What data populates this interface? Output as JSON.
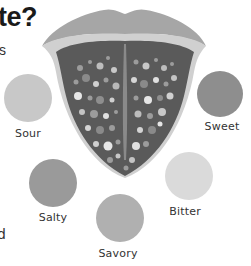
{
  "heading": {
    "title_fragment": "te?",
    "subtitle_fragment": "s",
    "bottom_fragment": "d"
  },
  "tongue": {
    "lip_color": "#a6a6a6",
    "rim_color": "#d0d0d0",
    "body_color": "#5a5a5a",
    "groove_color": "#8a8a8a"
  },
  "tastes": [
    {
      "label": "Sour",
      "color": "#c8c8c8",
      "cx": 28,
      "cy": 98,
      "r": 24,
      "label_x": 28,
      "label_y": 127
    },
    {
      "label": "Sweet",
      "color": "#8e8e8e",
      "cx": 220,
      "cy": 94,
      "r": 23,
      "label_x": 222,
      "label_y": 120
    },
    {
      "label": "Salty",
      "color": "#9a9a9a",
      "cx": 53,
      "cy": 183,
      "r": 24,
      "label_x": 53,
      "label_y": 211
    },
    {
      "label": "Bitter",
      "color": "#dadada",
      "cx": 189,
      "cy": 176,
      "r": 24,
      "label_x": 185,
      "label_y": 205
    },
    {
      "label": "Savory",
      "color": "#b0b0b0",
      "cx": 120,
      "cy": 218,
      "r": 24,
      "label_x": 118,
      "label_y": 247
    }
  ]
}
